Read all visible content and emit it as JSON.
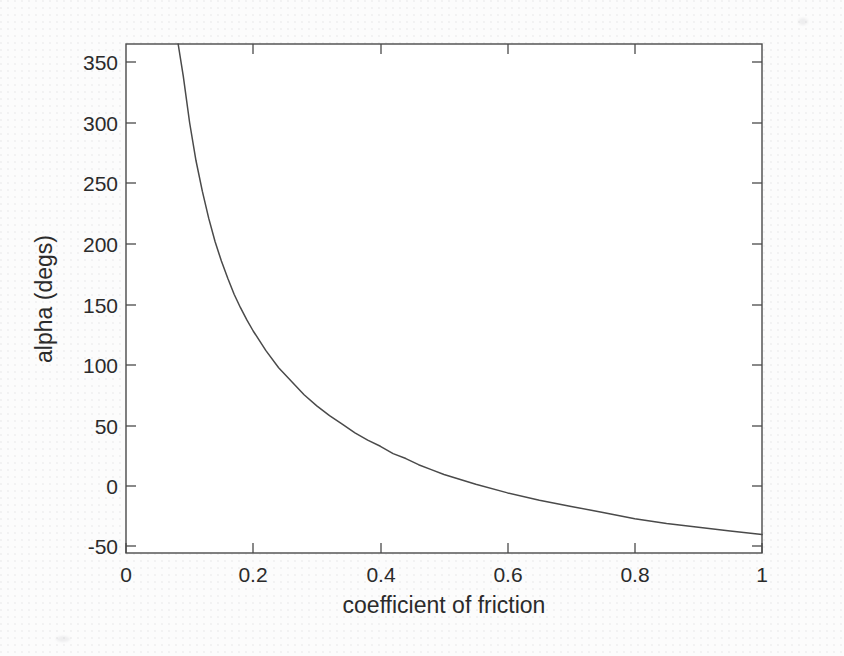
{
  "chart_data": {
    "type": "line",
    "title": "",
    "xlabel": "coefficient of friction",
    "ylabel": "alpha (degs)",
    "xlim": [
      0,
      1
    ],
    "ylim": [
      -55,
      360
    ],
    "xticks": [
      0,
      0.2,
      0.4,
      0.6,
      0.8,
      1
    ],
    "xticklabels": [
      "0",
      "0.2",
      "0.4",
      "0.6",
      "0.8",
      "1"
    ],
    "yticks": [
      -50,
      0,
      50,
      100,
      150,
      200,
      250,
      300,
      350
    ],
    "yticklabels": [
      "-50",
      "0",
      "50",
      "100",
      "150",
      "200",
      "250",
      "300",
      "350"
    ],
    "grid": false,
    "legend": null,
    "line_color": "#4a4a4a",
    "series": [
      {
        "name": "alpha vs coefficient of friction",
        "x": [
          0.082,
          0.09,
          0.1,
          0.11,
          0.12,
          0.13,
          0.14,
          0.15,
          0.16,
          0.17,
          0.18,
          0.19,
          0.2,
          0.22,
          0.24,
          0.26,
          0.28,
          0.3,
          0.32,
          0.34,
          0.36,
          0.38,
          0.4,
          0.42,
          0.44,
          0.46,
          0.48,
          0.5,
          0.55,
          0.6,
          0.65,
          0.7,
          0.75,
          0.8,
          0.85,
          0.9,
          0.95,
          1.0
        ],
        "y": [
          360,
          334,
          296,
          265,
          240,
          218,
          199,
          183,
          169,
          156,
          145,
          135,
          126,
          110,
          96,
          85,
          74,
          65,
          57,
          50,
          43,
          37,
          32,
          26,
          22,
          17,
          13,
          9,
          1,
          -6,
          -12,
          -17,
          -22,
          -27,
          -31,
          -34,
          -37,
          -40
        ]
      }
    ]
  },
  "figure": {
    "background_color": "#fcfcfc",
    "axis_color": "#4a4a4a",
    "text_color": "#2b2b2b"
  }
}
